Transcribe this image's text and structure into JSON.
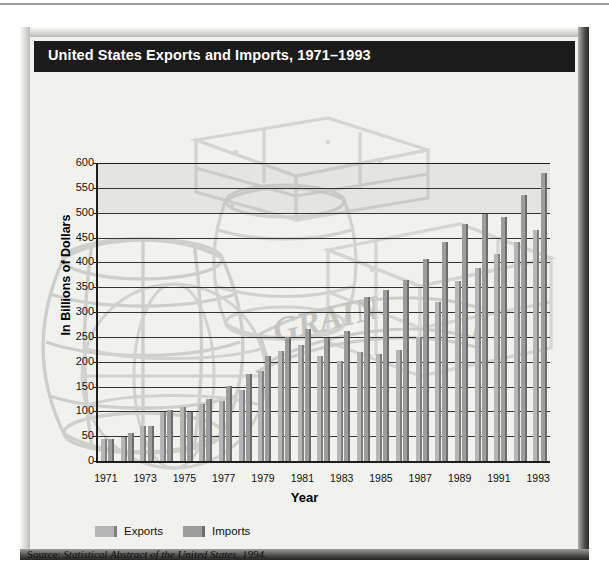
{
  "title": "United States Exports and Imports, 1971–1993",
  "source": {
    "prefix": "Source:",
    "citation": "Statistical Abstract of the United States, 1994."
  },
  "legend": {
    "position": "bottom-left",
    "items": [
      {
        "label": "Exports",
        "color": "#b6b6b6",
        "icon": "legend-swatch"
      },
      {
        "label": "Imports",
        "color": "#9d9d9d",
        "icon": "legend-swatch"
      }
    ]
  },
  "watermark": {
    "description": "faint grey line-art of stacked crates, wooden barrels, a globe and a ribbon banner reading GRAIN",
    "banner_text": "GRAIN",
    "color": "#d2d2ce"
  },
  "chart_data": {
    "type": "bar",
    "title": "United States Exports and Imports, 1971–1993",
    "xlabel": "Year",
    "ylabel": "In Billions of Dollars",
    "ylim": [
      0,
      600
    ],
    "yticks": [
      0,
      50,
      100,
      150,
      200,
      250,
      300,
      350,
      400,
      450,
      500,
      550,
      600
    ],
    "grid": true,
    "legend_position": "bottom-left",
    "categories": [
      "1971",
      "1972",
      "1973",
      "1974",
      "1975",
      "1976",
      "1977",
      "1978",
      "1979",
      "1980",
      "1981",
      "1982",
      "1983",
      "1984",
      "1985",
      "1986",
      "1987",
      "1988",
      "1989",
      "1990",
      "1991",
      "1992",
      "1993"
    ],
    "tick_labels": [
      "1971",
      "",
      "1973",
      "",
      "1975",
      "",
      "1977",
      "",
      "1979",
      "",
      "1981",
      "",
      "1983",
      "",
      "1985",
      "",
      "1987",
      "",
      "1989",
      "",
      "1991",
      "",
      "1993"
    ],
    "series": [
      {
        "name": "Exports",
        "color": "#b6b6b6",
        "values": [
          44,
          49,
          71,
          98,
          108,
          115,
          121,
          143,
          182,
          221,
          234,
          212,
          201,
          220,
          215,
          224,
          250,
          320,
          362,
          389,
          416,
          440,
          465
        ]
      },
      {
        "name": "Imports",
        "color": "#9d9d9d",
        "values": [
          45,
          56,
          70,
          103,
          98,
          124,
          152,
          176,
          212,
          249,
          265,
          247,
          261,
          330,
          345,
          365,
          406,
          441,
          477,
          498,
          491,
          536,
          580
        ]
      }
    ]
  }
}
